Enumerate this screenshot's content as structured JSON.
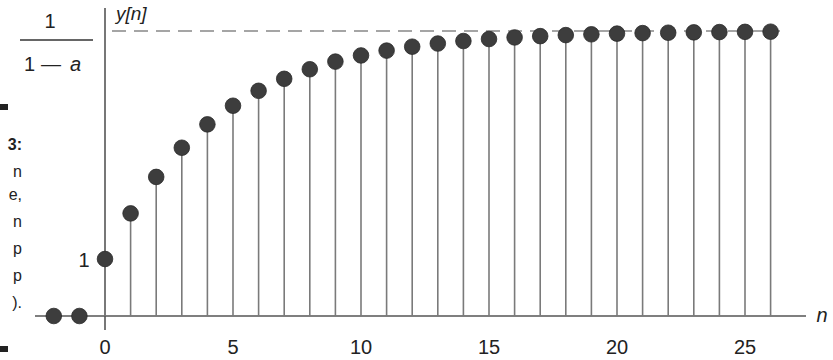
{
  "chart_data": {
    "type": "stem",
    "title": "",
    "xlabel": "n",
    "ylabel": "y[n]",
    "x_ticks": [
      0,
      5,
      10,
      15,
      20,
      25
    ],
    "y_tick_labels": [
      {
        "value": 1,
        "label": "1"
      },
      {
        "value": 5,
        "label": "1/(1 − a)",
        "numerator": "1",
        "denominator": "1 − a"
      }
    ],
    "asymptote": {
      "value": 5,
      "style": "dashed",
      "label": "1/(1 − a)"
    },
    "parameter_a": 0.8,
    "xlim": [
      -2.8,
      27.2
    ],
    "ylim": [
      0,
      5.4
    ],
    "grid": false,
    "x": [
      -2,
      -1,
      0,
      1,
      2,
      3,
      4,
      5,
      6,
      7,
      8,
      9,
      10,
      11,
      12,
      13,
      14,
      15,
      16,
      17,
      18,
      19,
      20,
      21,
      22,
      23,
      24,
      25,
      26
    ],
    "values": [
      0,
      0,
      1.0,
      1.8,
      2.44,
      2.952,
      3.362,
      3.689,
      3.951,
      4.161,
      4.329,
      4.463,
      4.571,
      4.656,
      4.725,
      4.78,
      4.824,
      4.859,
      4.887,
      4.91,
      4.928,
      4.942,
      4.954,
      4.963,
      4.97,
      4.976,
      4.981,
      4.985,
      4.988
    ]
  },
  "labels": {
    "y_axis": "y[n]",
    "x_axis": "n",
    "y_one": "1",
    "frac_num": "1",
    "frac_den_1": "1",
    "frac_den_dash": "—",
    "frac_den_a": "a"
  },
  "caption_fragments": [
    "3:",
    "n",
    "e,",
    "n",
    "p",
    "p",
    ")."
  ],
  "colors": {
    "marker": "#3d3d3d",
    "stem": "#7a7a7a",
    "axis": "#555555",
    "dashed": "#888888",
    "text": "#222222"
  }
}
